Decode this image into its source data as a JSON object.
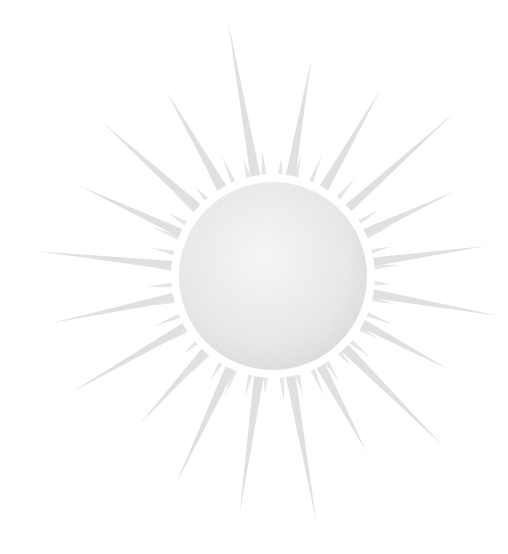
{
  "image": {
    "subject": "sun illustration",
    "width": 508,
    "height": 554,
    "background": "#ffffff",
    "center": [
      273,
      276
    ],
    "disc_radius": 94,
    "halo_radius": 102,
    "colors": {
      "disc_light": "#f7f7f7",
      "disc_dark": "#e2e2e2",
      "halo": "#ffffff",
      "ray": "#d6d6d6",
      "short_ray": "#e0e0e0"
    },
    "long_rays": [
      {
        "angle": -100,
        "length": 260,
        "width": 10
      },
      {
        "angle": -80,
        "length": 220,
        "width": 10
      },
      {
        "angle": -60,
        "length": 215,
        "width": 10
      },
      {
        "angle": -42,
        "length": 245,
        "width": 9
      },
      {
        "angle": -25,
        "length": 200,
        "width": 9
      },
      {
        "angle": -8,
        "length": 215,
        "width": 9
      },
      {
        "angle": 10,
        "length": 230,
        "width": 9
      },
      {
        "angle": 28,
        "length": 200,
        "width": 9
      },
      {
        "angle": 45,
        "length": 240,
        "width": 10
      },
      {
        "angle": 62,
        "length": 200,
        "width": 10
      },
      {
        "angle": 80,
        "length": 250,
        "width": 10
      },
      {
        "angle": 98,
        "length": 240,
        "width": 10
      },
      {
        "angle": 115,
        "length": 230,
        "width": 10
      },
      {
        "angle": 132,
        "length": 200,
        "width": 9
      },
      {
        "angle": 150,
        "length": 235,
        "width": 9
      },
      {
        "angle": 168,
        "length": 225,
        "width": 9
      },
      {
        "angle": 186,
        "length": 235,
        "width": 9
      },
      {
        "angle": 205,
        "length": 215,
        "width": 9
      },
      {
        "angle": 222,
        "length": 230,
        "width": 10
      },
      {
        "angle": 240,
        "length": 215,
        "width": 10
      }
    ],
    "short_ray_count": 40,
    "short_ray_length": 30
  }
}
